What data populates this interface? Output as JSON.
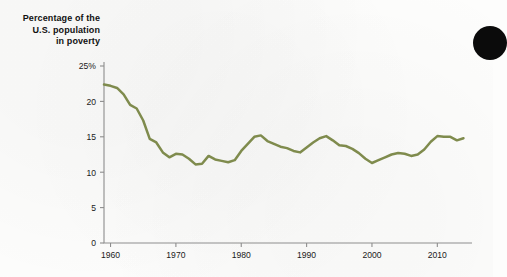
{
  "figure": {
    "title_lines": [
      "Percentage of the",
      "U.S. population",
      "in poverty"
    ],
    "line_color": "#7f8b4d",
    "axis_color": "#8d8d8d",
    "text_color": "#1a1a1a",
    "marker": "black-circle"
  },
  "chart_data": {
    "type": "line",
    "title": "Percentage of the U.S. population in poverty",
    "xlabel": "",
    "ylabel": "Percentage of the U.S. population in poverty",
    "xlim": [
      1959,
      2015
    ],
    "ylim": [
      0,
      25
    ],
    "ytick_labels": [
      "0",
      "5",
      "10",
      "15",
      "20",
      "25%"
    ],
    "yticks": [
      0,
      5,
      10,
      15,
      20,
      25
    ],
    "xtick_labels": [
      "1960",
      "1970",
      "1980",
      "1990",
      "2000",
      "2010"
    ],
    "xticks": [
      1960,
      1970,
      1980,
      1990,
      2000,
      2010
    ],
    "grid": false,
    "legend": "none",
    "series": [
      {
        "name": "U.S. poverty rate",
        "color": "#7f8b4d",
        "x": [
          1959,
          1960,
          1961,
          1962,
          1963,
          1964,
          1965,
          1966,
          1967,
          1968,
          1969,
          1970,
          1971,
          1972,
          1973,
          1974,
          1975,
          1976,
          1977,
          1978,
          1979,
          1980,
          1981,
          1982,
          1983,
          1984,
          1985,
          1986,
          1987,
          1988,
          1989,
          1990,
          1991,
          1992,
          1993,
          1994,
          1995,
          1996,
          1997,
          1998,
          1999,
          2000,
          2001,
          2002,
          2003,
          2004,
          2005,
          2006,
          2007,
          2008,
          2009,
          2010,
          2011,
          2012,
          2013,
          2014
        ],
        "values": [
          22.4,
          22.2,
          21.9,
          21.0,
          19.5,
          19.0,
          17.3,
          14.7,
          14.2,
          12.8,
          12.1,
          12.6,
          12.5,
          11.9,
          11.1,
          11.2,
          12.3,
          11.8,
          11.6,
          11.4,
          11.7,
          13.0,
          14.0,
          15.0,
          15.2,
          14.4,
          14.0,
          13.6,
          13.4,
          13.0,
          12.8,
          13.5,
          14.2,
          14.8,
          15.1,
          14.5,
          13.8,
          13.7,
          13.3,
          12.7,
          11.9,
          11.3,
          11.7,
          12.1,
          12.5,
          12.7,
          12.6,
          12.3,
          12.5,
          13.2,
          14.3,
          15.1,
          15.0,
          15.0,
          14.5,
          14.8
        ]
      }
    ]
  }
}
